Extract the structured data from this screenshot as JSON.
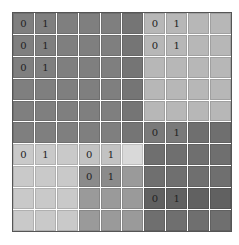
{
  "board": {
    "rows": 10,
    "cols": 10,
    "palette": {
      "D": "#7f7f7f",
      "d": "#757575",
      "L": "#b7b7b7",
      "P": "#c9c9c9",
      "Q": "#c2c2c2",
      "W": "#d9d9d9",
      "M": "#8b8b8b",
      "m": "#9a9a9a",
      "K": "#6f6f6f",
      "k": "#616161",
      "R": "#7a7a7a"
    },
    "colors": [
      [
        "D",
        "D",
        "D",
        "D",
        "D",
        "d",
        "L",
        "L",
        "L",
        "L"
      ],
      [
        "D",
        "D",
        "D",
        "D",
        "D",
        "d",
        "L",
        "L",
        "L",
        "L"
      ],
      [
        "D",
        "D",
        "D",
        "D",
        "D",
        "d",
        "L",
        "L",
        "L",
        "L"
      ],
      [
        "D",
        "D",
        "D",
        "D",
        "D",
        "d",
        "L",
        "L",
        "L",
        "L"
      ],
      [
        "D",
        "D",
        "D",
        "D",
        "D",
        "d",
        "L",
        "L",
        "L",
        "L"
      ],
      [
        "D",
        "D",
        "D",
        "D",
        "D",
        "d",
        "R",
        "R",
        "K",
        "K"
      ],
      [
        "P",
        "P",
        "P",
        "Q",
        "Q",
        "W",
        "K",
        "K",
        "K",
        "K"
      ],
      [
        "P",
        "P",
        "P",
        "M",
        "M",
        "m",
        "K",
        "K",
        "K",
        "K"
      ],
      [
        "P",
        "P",
        "P",
        "m",
        "m",
        "m",
        "k",
        "k",
        "k",
        "k"
      ],
      [
        "P",
        "P",
        "P",
        "m",
        "m",
        "m",
        "K",
        "K",
        "K",
        "K"
      ]
    ],
    "labels": [
      [
        "0",
        "1",
        "",
        "",
        "",
        "",
        "0",
        "1",
        "",
        ""
      ],
      [
        "0",
        "1",
        "",
        "",
        "",
        "",
        "0",
        "1",
        "",
        ""
      ],
      [
        "0",
        "1",
        "",
        "",
        "",
        "",
        "",
        "",
        "",
        ""
      ],
      [
        "",
        "",
        "",
        "",
        "",
        "",
        "",
        "",
        "",
        ""
      ],
      [
        "",
        "",
        "",
        "",
        "",
        "",
        "",
        "",
        "",
        ""
      ],
      [
        "",
        "",
        "",
        "",
        "",
        "",
        "0",
        "1",
        "",
        ""
      ],
      [
        "0",
        "1",
        "",
        "0",
        "1",
        "",
        "",
        "",
        "",
        ""
      ],
      [
        "",
        "",
        "",
        "0",
        "1",
        "",
        "",
        "",
        "",
        ""
      ],
      [
        "",
        "",
        "",
        "",
        "",
        "",
        "0",
        "1",
        "",
        ""
      ],
      [
        "",
        "",
        "",
        "",
        "",
        "",
        "",
        "",
        "",
        ""
      ]
    ]
  }
}
